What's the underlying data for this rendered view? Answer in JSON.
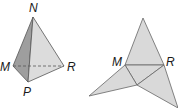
{
  "figure_left": {
    "title": "Triangular pyramid",
    "labels": {
      "apex": "N",
      "left": "M",
      "right": "R",
      "front": "P"
    },
    "colors": {
      "dark_face": "#9e9e9e",
      "light_face": "#dcdcdc",
      "edge": "#555555"
    }
  },
  "figure_right": {
    "title": "Net of pyramid",
    "labels": {
      "left": "M",
      "right": "R"
    },
    "colors": {
      "face": "#d9d9d9",
      "edge": "#666666"
    }
  }
}
